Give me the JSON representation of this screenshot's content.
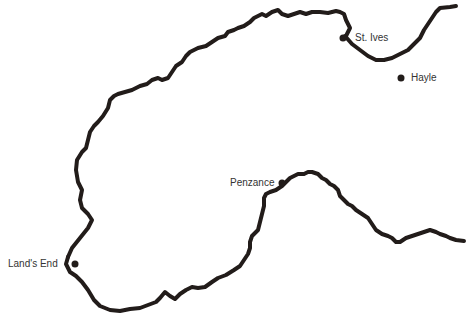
{
  "map": {
    "coast_color": "#221c1a",
    "label_color": "#333333",
    "places": [
      {
        "name": "St. Ives",
        "dot": [
          343,
          38
        ],
        "label_pos": [
          355,
          32
        ]
      },
      {
        "name": "Hayle",
        "dot": [
          401,
          78
        ],
        "label_pos": [
          411,
          72
        ]
      },
      {
        "name": "Penzance",
        "dot": [
          282,
          183
        ],
        "label_pos": [
          230,
          177
        ]
      },
      {
        "name": "Land's End",
        "dot": [
          75,
          264
        ],
        "label_pos": [
          8,
          258
        ]
      }
    ]
  }
}
